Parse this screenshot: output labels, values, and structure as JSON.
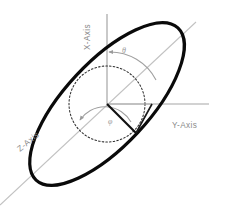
{
  "figure": {
    "background_color": "#ffffff",
    "width": 229,
    "height": 208
  },
  "axes": {
    "x": {
      "label": "X-Axis",
      "orientation": "vertical",
      "color": "#9a9a9a",
      "label_rotation_deg": -90
    },
    "y": {
      "label": "Y-Axis",
      "orientation": "horizontal",
      "color": "#9a9a9a",
      "label_rotation_deg": 0
    },
    "z": {
      "label": "Z-Axis",
      "orientation": "diagonal",
      "color": "#b5b5b5",
      "label_rotation_deg": -40
    }
  },
  "angles": {
    "theta": {
      "symbol": "θ",
      "description": "polar angle measured from X-Axis toward Z-Axis",
      "color": "#9a9a9a"
    },
    "phi": {
      "symbol": "φ",
      "description": "azimuth angle measured in the reference plane",
      "color": "#9a9a9a"
    }
  },
  "shapes": {
    "ellipse": {
      "name": "orbit-ellipse",
      "stroke_color": "#0a0a0a",
      "stroke_width": 3.2,
      "rotation_deg": -47,
      "semi_major": 104,
      "semi_minor": 42,
      "center": [
        107,
        104
      ]
    },
    "circle": {
      "name": "reference-circle",
      "stroke_color": "#2b2b2b",
      "stroke_style": "dotted",
      "radius": 38,
      "center": [
        107,
        104
      ]
    },
    "vector": {
      "name": "position-vector",
      "stroke_color": "#111111",
      "origin": [
        107,
        104
      ],
      "tip": [
        136,
        133
      ]
    },
    "origin": {
      "name": "origin-point",
      "coordinates": [
        107,
        104
      ]
    }
  }
}
